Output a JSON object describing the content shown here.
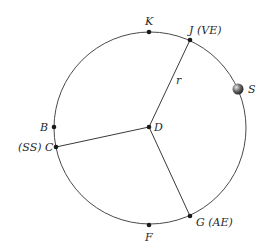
{
  "diagram": {
    "center": {
      "label": "D",
      "x": 149,
      "y": 127
    },
    "radius": 96,
    "radius_label": "r",
    "points": [
      {
        "id": "K",
        "label": "K",
        "x": 149,
        "y": 31
      },
      {
        "id": "J",
        "label": "J (VE)",
        "x": 190,
        "y": 40
      },
      {
        "id": "B",
        "label": "B",
        "x": 54,
        "y": 127
      },
      {
        "id": "C",
        "label": "(SS) C",
        "x": 56,
        "y": 147
      },
      {
        "id": "F",
        "label": "F",
        "x": 149,
        "y": 225
      },
      {
        "id": "G",
        "label": "G (AE)",
        "x": 190,
        "y": 216
      }
    ],
    "sun": {
      "label": "S",
      "x": 238,
      "y": 89
    },
    "radii_to": [
      "J",
      "C",
      "G"
    ],
    "colors": {
      "circle": "#4a4a4a",
      "points": "#1a1a1a",
      "sun": "#555555"
    }
  }
}
